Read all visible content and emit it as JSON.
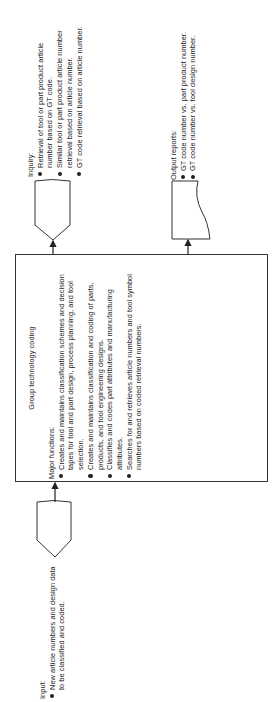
{
  "input": {
    "heading": "Input:",
    "items": [
      "New article numbers and design data\nto be classified and coded."
    ]
  },
  "process": {
    "title": "Group technology coding",
    "heading": "Major functions:",
    "items": [
      "Creates and maintains classification schemes and decision\ntapes for tool and part design, process planning, and tool\nselection.",
      "Creates and maintains classification and coding of parts,\nproducts, and tool engineering designs.",
      "Classifies and codes part attributes and manufacturing\nattributes.",
      "Searches for and retrieves article numbers and tool symbol\nnumbers based on coded retrieval numbers."
    ]
  },
  "inquiry": {
    "heading": "Inquiry:",
    "items": [
      "Retrieval of tool or part product article\nnumber based on GT code.",
      "Similar tool or part product article number\nretrieval based on article number.",
      "GT code retrieval based on article number."
    ]
  },
  "output": {
    "heading": "Output reports:",
    "items": [
      "GT code number vs. part product number.",
      "GT code number vs. tool design number."
    ]
  },
  "colors": {
    "line": "#333333",
    "text": "#222222",
    "background": "#ffffff"
  }
}
